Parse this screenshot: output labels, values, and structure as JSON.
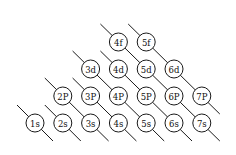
{
  "diagram": {
    "orbitals": [
      {
        "label": "1s",
        "n": 1,
        "l": 0
      },
      {
        "label": "2s",
        "n": 2,
        "l": 0
      },
      {
        "label": "3s",
        "n": 3,
        "l": 0
      },
      {
        "label": "4s",
        "n": 4,
        "l": 0
      },
      {
        "label": "5s",
        "n": 5,
        "l": 0
      },
      {
        "label": "6s",
        "n": 6,
        "l": 0
      },
      {
        "label": "7s",
        "n": 7,
        "l": 0
      },
      {
        "label": "2P",
        "n": 2,
        "l": 1
      },
      {
        "label": "3P",
        "n": 3,
        "l": 1
      },
      {
        "label": "4P",
        "n": 4,
        "l": 1
      },
      {
        "label": "5P",
        "n": 5,
        "l": 1
      },
      {
        "label": "6P",
        "n": 6,
        "l": 1
      },
      {
        "label": "7P",
        "n": 7,
        "l": 1
      },
      {
        "label": "3d",
        "n": 3,
        "l": 2
      },
      {
        "label": "4d",
        "n": 4,
        "l": 2
      },
      {
        "label": "5d",
        "n": 5,
        "l": 2
      },
      {
        "label": "6d",
        "n": 6,
        "l": 2
      },
      {
        "label": "4f",
        "n": 4,
        "l": 3
      },
      {
        "label": "5f",
        "n": 5,
        "l": 3
      }
    ],
    "diagonals": [
      [
        "1s"
      ],
      [
        "2s"
      ],
      [
        "2P",
        "3s"
      ],
      [
        "3P",
        "4s"
      ],
      [
        "3d",
        "4P",
        "5s"
      ],
      [
        "4d",
        "5P",
        "6s"
      ],
      [
        "4f",
        "5d",
        "6P",
        "7s"
      ],
      [
        "5f",
        "6d",
        "7P"
      ]
    ]
  }
}
